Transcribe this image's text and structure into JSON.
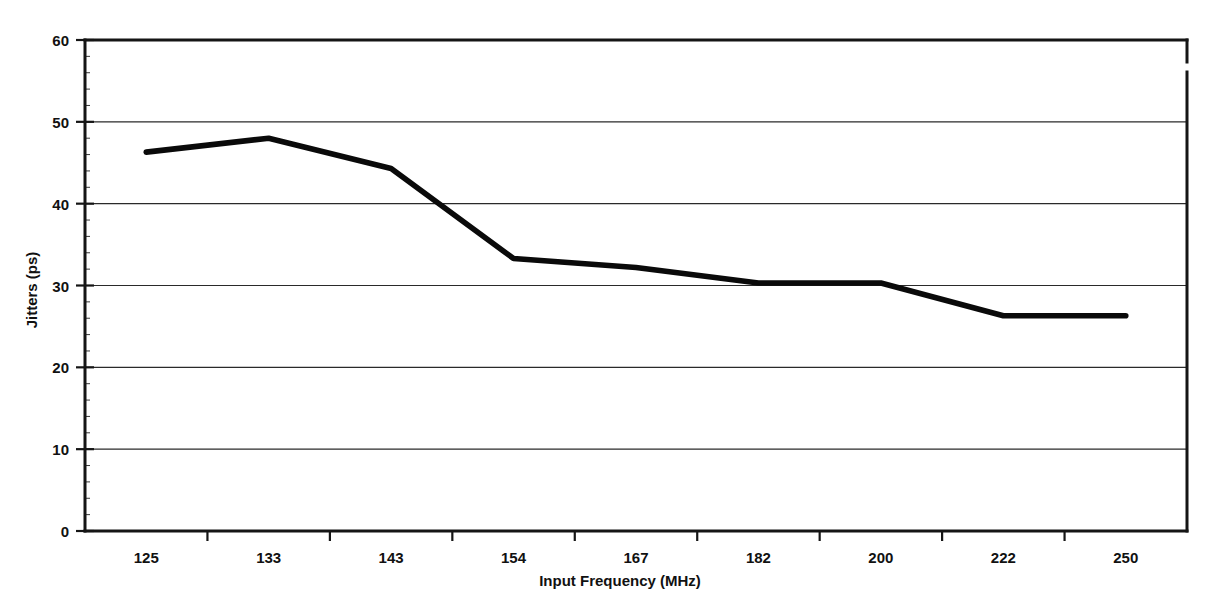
{
  "chart_data": {
    "type": "line",
    "title": "",
    "subtitle": "",
    "xlabel": "Input Frequency (MHz)",
    "ylabel": "Jitters (ps)",
    "categories": [
      "125",
      "133",
      "143",
      "154",
      "167",
      "182",
      "200",
      "222",
      "250"
    ],
    "values": [
      46.3,
      48.0,
      44.3,
      33.3,
      32.2,
      30.3,
      30.3,
      26.3,
      26.3
    ],
    "series": [
      {
        "name": "Jitters",
        "values": [
          46.3,
          48.0,
          44.3,
          33.3,
          32.2,
          30.3,
          30.3,
          26.3,
          26.3
        ]
      }
    ],
    "ylim": [
      0,
      60
    ],
    "yticks": [
      0,
      10,
      20,
      30,
      40,
      50,
      60
    ],
    "ytick_labels": [
      "0",
      "10",
      "20",
      "30",
      "40",
      "50",
      "60"
    ],
    "xtick_labels": [
      "125",
      "133",
      "143",
      "154",
      "167",
      "182",
      "200",
      "222",
      "250"
    ],
    "grid": "horizontal",
    "legend": "none",
    "legend_position": "none",
    "line_color": "#0a0a0a",
    "background_color": "#ffffff",
    "axis_color": "#151515",
    "annotations": []
  },
  "figure": {
    "name": "jitters-vs-input-frequency-line-chart"
  }
}
